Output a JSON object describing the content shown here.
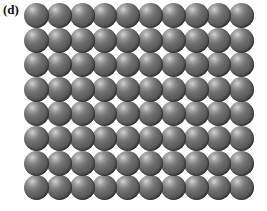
{
  "figure": {
    "panel_label": "(d)",
    "background_color": "#ffffff"
  },
  "lattice": {
    "columns": 10,
    "rows": 8,
    "total_spheres": 80,
    "packing": "square",
    "sphere_diameter_px": 25,
    "column_spacing_px": 22.8,
    "row_spacing_px": 24.6,
    "origin_x_px": 24,
    "origin_y_px": 3
  },
  "sphere_style": {
    "highlight_color": "#d2d2d2",
    "midtone_color": "#6e6e6e",
    "shadow_color": "#2e2e2e",
    "highlight_position": "upper-left",
    "gap_color": "#ffffff"
  }
}
